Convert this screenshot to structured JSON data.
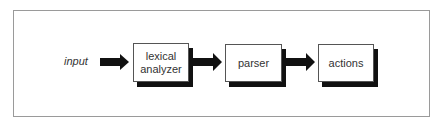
{
  "diagram": {
    "type": "flowchart",
    "direction": "left-to-right",
    "input_label": "input",
    "nodes": [
      {
        "id": "lexical-analyzer",
        "label_line1": "lexical",
        "label_line2": "analyzer"
      },
      {
        "id": "parser",
        "label": "parser"
      },
      {
        "id": "actions",
        "label": "actions"
      }
    ],
    "edges": [
      {
        "from": "input",
        "to": "lexical-analyzer"
      },
      {
        "from": "lexical-analyzer",
        "to": "parser"
      },
      {
        "from": "parser",
        "to": "actions"
      }
    ],
    "colors": {
      "arrow": "#111111",
      "box_border": "#555555",
      "shadow": "#111111",
      "frame": "#9a9a9a"
    }
  }
}
